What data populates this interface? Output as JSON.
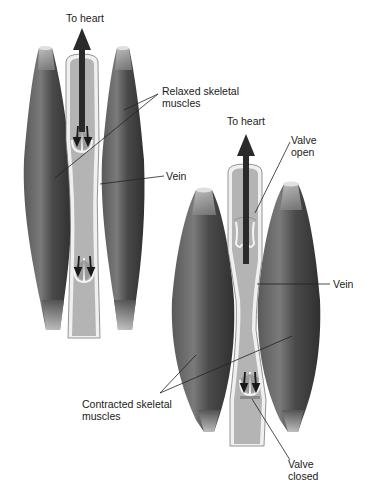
{
  "figure": {
    "panels": [
      {
        "id": "relaxed",
        "labels": {
          "to_heart": "To heart",
          "muscles_line1": "Relaxed skeletal",
          "muscles_line2": "muscles",
          "vein": "Vein"
        }
      },
      {
        "id": "contracted",
        "labels": {
          "to_heart": "To heart",
          "valve_open_line1": "Valve",
          "valve_open_line2": "open",
          "vein": "Vein",
          "muscles_line1": "Contracted skeletal",
          "muscles_line2": "muscles",
          "valve_closed_line1": "Valve",
          "valve_closed_line2": "closed"
        }
      }
    ],
    "colors": {
      "background": "#ffffff",
      "muscle_dark": "#3a3a3a",
      "muscle_mid": "#6a6a6a",
      "tendon": "#c8c8c8",
      "vein_fill": "#b4b4b4",
      "vein_wall": "#f2f2f2",
      "arrow": "#2a2a2a",
      "leader_line": "#222222"
    }
  }
}
